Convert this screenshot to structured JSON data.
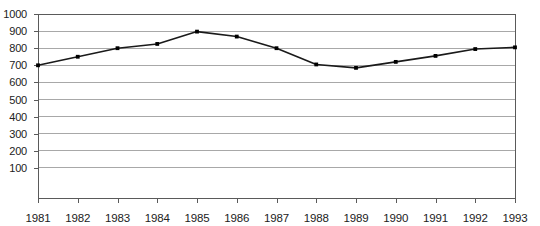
{
  "chart_data": {
    "type": "line",
    "title": "",
    "subtitle": "",
    "xlabel": "",
    "ylabel": "",
    "categories": [
      1981,
      1982,
      1983,
      1984,
      1985,
      1986,
      1987,
      1988,
      1989,
      1990,
      1991,
      1992,
      1993
    ],
    "x_tick_labels": [
      "1981",
      "1982",
      "1983",
      "1984",
      "1985",
      "1986",
      "1987",
      "1988",
      "1989",
      "1990",
      "1991",
      "1992",
      "1993"
    ],
    "values": [
      700,
      750,
      800,
      825,
      897,
      868,
      800,
      705,
      685,
      720,
      755,
      795,
      805
    ],
    "series": [
      {
        "name": "series-1",
        "values": [
          700,
          750,
          800,
          825,
          897,
          868,
          800,
          705,
          685,
          720,
          755,
          795,
          805
        ],
        "line_color": "#1a1a1a",
        "marker": "square",
        "marker_color": "#000000"
      }
    ],
    "ylim": [
      0,
      1000
    ],
    "xlim": [
      1981,
      1993
    ],
    "y_ticks": [
      100,
      200,
      300,
      400,
      500,
      600,
      700,
      800,
      900,
      1000
    ],
    "y_tick_labels": [
      "100",
      "200",
      "300",
      "400",
      "500",
      "600",
      "700",
      "800",
      "900",
      "1000"
    ],
    "grid": true,
    "grid_axis": "y",
    "grid_color": "#a8a8a8",
    "frame_color": "#5a5a5a",
    "axis_color": "#5a5a5a",
    "legend": false,
    "legend_position": "none",
    "annotations": []
  },
  "plot_geometry": {
    "left": 38,
    "right": 515,
    "top": 14,
    "bottom": 185,
    "baseline_y": 198,
    "tick_length": 5,
    "x_label_y": 212
  }
}
